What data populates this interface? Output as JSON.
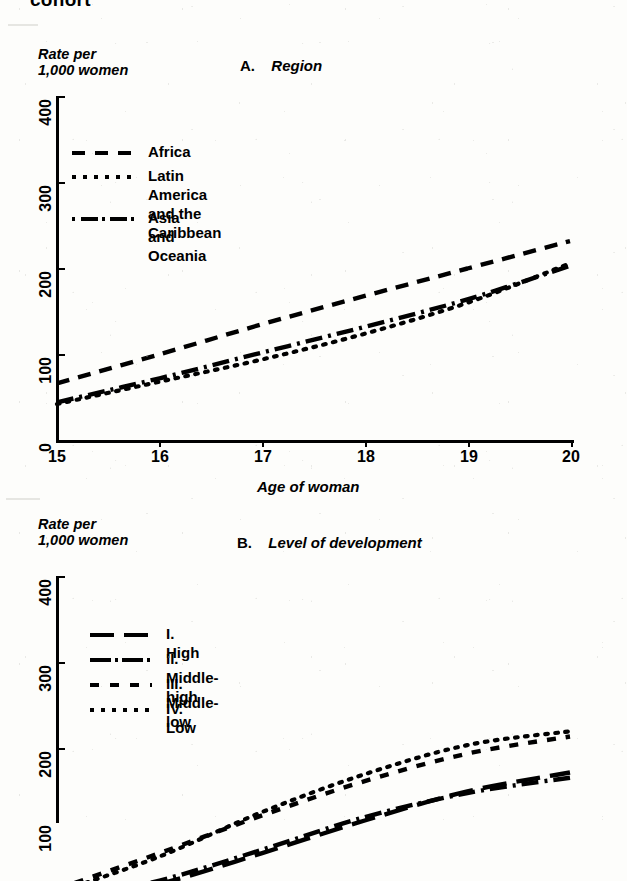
{
  "page": {
    "top_cut_heading": "cohort",
    "background": "#fdfdfb",
    "ink": "#000000"
  },
  "panel_a": {
    "title_label": "A.",
    "title_text": "Region",
    "y_caption": "Rate per\n1,000 women",
    "x_title": "Age of woman",
    "y_ticks": [
      "0",
      "100",
      "200",
      "300",
      "400"
    ],
    "x_ticks": [
      "15",
      "16",
      "17",
      "18",
      "19",
      "20"
    ],
    "legend": [
      {
        "style": "dash",
        "label": "Africa"
      },
      {
        "style": "dot",
        "label": "Latin America\nand the Caribbean"
      },
      {
        "style": "dashdot",
        "label": "Asia and Oceania"
      }
    ]
  },
  "panel_b": {
    "title_label": "B.",
    "title_text": "Level of development",
    "y_caption": "Rate per\n1,000 women",
    "y_ticks": [
      "100",
      "200",
      "300",
      "400"
    ],
    "legend": [
      {
        "style": "longdash",
        "label": "I.   High"
      },
      {
        "style": "dashdot",
        "label": "II.  Middle-high"
      },
      {
        "style": "shortdash",
        "label": "III. Middle-low"
      },
      {
        "style": "dot",
        "label": "IV.  Low"
      }
    ]
  },
  "chart_data": [
    {
      "type": "line",
      "id": "A",
      "title": "A.  Region",
      "xlabel": "Age of woman",
      "ylabel": "Rate per 1,000 women",
      "x": [
        15,
        16,
        17,
        18,
        19,
        20
      ],
      "xlim": [
        15,
        20
      ],
      "ylim": [
        0,
        400
      ],
      "yticks": [
        0,
        100,
        200,
        300,
        400
      ],
      "grid": false,
      "legend_position": "upper-left",
      "series": [
        {
          "name": "Africa",
          "style": "dashed",
          "values": [
            66,
            100,
            135,
            168,
            200,
            232
          ]
        },
        {
          "name": "Latin America and the Caribbean",
          "style": "dotted",
          "values": [
            42,
            68,
            94,
            124,
            160,
            206
          ]
        },
        {
          "name": "Asia and Oceania",
          "style": "dash-dot",
          "values": [
            44,
            72,
            102,
            132,
            164,
            203
          ]
        }
      ]
    },
    {
      "type": "line",
      "id": "B",
      "title": "B.  Level of development",
      "xlabel": "Age of woman",
      "ylabel": "Rate per 1,000 women",
      "x": [
        15,
        16,
        17,
        18,
        19,
        20
      ],
      "xlim": [
        15,
        20
      ],
      "ylim": [
        0,
        400
      ],
      "yticks": [
        100,
        200,
        300,
        400
      ],
      "grid": false,
      "legend_position": "upper-left",
      "note": "lower portion of panel B is cropped by the page edge",
      "series": [
        {
          "name": "I. High",
          "style": "long-dash",
          "values": [
            18,
            42,
            78,
            116,
            150,
            172
          ]
        },
        {
          "name": "II. Middle-high",
          "style": "dash-dot",
          "values": [
            20,
            46,
            82,
            120,
            148,
            166
          ]
        },
        {
          "name": "III. Middle-low",
          "style": "short-dash",
          "values": [
            36,
            78,
            122,
            162,
            194,
            214
          ]
        },
        {
          "name": "IV. Low",
          "style": "dotted",
          "values": [
            32,
            74,
            126,
            170,
            204,
            220
          ]
        }
      ]
    }
  ]
}
